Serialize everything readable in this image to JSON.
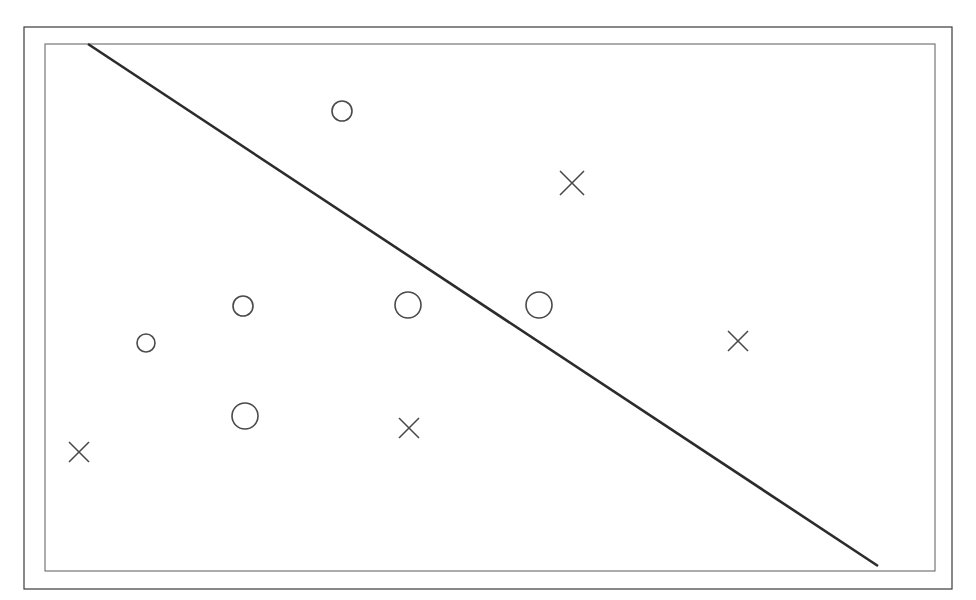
{
  "figure": {
    "width": 976,
    "height": 600,
    "background_color": "#ffffff"
  },
  "frames": {
    "outer": {
      "name": "outer-border",
      "x": 24,
      "y": 27,
      "width": 928,
      "height": 562,
      "stroke_color": "#3a3a3a",
      "stroke_width": 1.2
    },
    "inner": {
      "name": "inner-border",
      "x": 45,
      "y": 44,
      "width": 890,
      "height": 527,
      "stroke_color": "#6b6b6b",
      "stroke_width": 1.1
    }
  },
  "boundary": {
    "name": "decision-boundary",
    "x1": 88,
    "y1": 44,
    "x2": 878,
    "y2": 566,
    "stroke_color": "#2b2b2b",
    "stroke_width": 2.6
  },
  "chart_data": {
    "type": "scatter",
    "title": "",
    "subtitle": "",
    "xlabel": "",
    "ylabel": "",
    "grid": false,
    "legend": "none",
    "axis_ticks": false,
    "xlim": [
      45,
      935
    ],
    "ylim": [
      44,
      571
    ],
    "annotations": [],
    "decision_boundary": {
      "label": "separating line",
      "start": [
        88,
        44
      ],
      "end": [
        878,
        566
      ],
      "slope_px": 0.661,
      "color": "#2b2b2b"
    },
    "series": [
      {
        "name": "circle-class",
        "marker": "circle",
        "color": "#4a4a4a",
        "stroke_width": 1.6,
        "points": [
          {
            "id": "o1",
            "x": 342,
            "y": 111,
            "r": 10
          },
          {
            "id": "o2",
            "x": 243,
            "y": 306,
            "r": 10
          },
          {
            "id": "o3",
            "x": 146,
            "y": 343,
            "r": 9
          },
          {
            "id": "o4",
            "x": 408,
            "y": 305,
            "r": 13
          },
          {
            "id": "o5",
            "x": 539,
            "y": 305,
            "r": 13
          },
          {
            "id": "o6",
            "x": 245,
            "y": 416,
            "r": 13
          }
        ]
      },
      {
        "name": "cross-class",
        "marker": "x",
        "color": "#4a4a4a",
        "stroke_width": 1.6,
        "points": [
          {
            "id": "x1",
            "x": 572,
            "y": 183,
            "s": 12
          },
          {
            "id": "x2",
            "x": 738,
            "y": 341,
            "s": 10
          },
          {
            "id": "x3",
            "x": 409,
            "y": 428,
            "s": 10
          },
          {
            "id": "x4",
            "x": 79,
            "y": 452,
            "s": 10
          }
        ]
      }
    ]
  }
}
